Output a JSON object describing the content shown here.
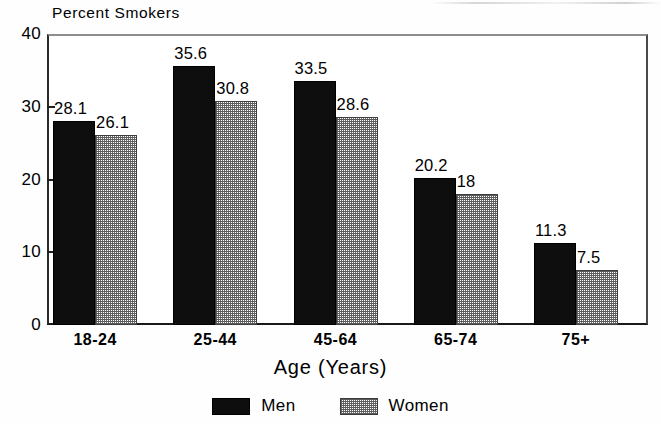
{
  "chart_data": {
    "type": "bar",
    "title": "Percent Smokers",
    "xlabel": "Age (Years)",
    "ylabel": "",
    "categories": [
      "18-24",
      "25-44",
      "45-64",
      "65-74",
      "75+"
    ],
    "series": [
      {
        "name": "Men",
        "color": "#0e0e0e",
        "fill": "solid-black",
        "values": [
          28.1,
          35.6,
          33.5,
          20.2,
          11.3
        ],
        "value_labels": [
          "28.1",
          "35.6",
          "33.5",
          "20.2",
          "11.3"
        ]
      },
      {
        "name": "Women",
        "color": "#808080",
        "fill": "gray-checkered-hatch",
        "values": [
          26.1,
          30.8,
          28.6,
          18,
          7.5
        ],
        "value_labels": [
          "26.1",
          "30.8",
          "28.6",
          "18",
          "7.5"
        ]
      }
    ],
    "ylim": [
      0,
      40
    ],
    "yticks": [
      0,
      10,
      20,
      30,
      40
    ],
    "ytick_labels": [
      "0",
      "10",
      "20",
      "30",
      "40"
    ],
    "grid": false,
    "legend_position": "bottom-center",
    "value_labels_shown": true
  },
  "legend": {
    "items": [
      {
        "label": "Men",
        "swatch": "solid-black-swatch"
      },
      {
        "label": "Women",
        "swatch": "gray-hatch-swatch"
      }
    ]
  }
}
